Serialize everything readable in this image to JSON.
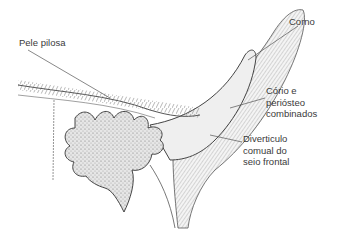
{
  "diagram": {
    "labels": [
      {
        "id": "pele",
        "text": "Pele pilosa"
      },
      {
        "id": "corno",
        "text": "Corno"
      },
      {
        "id": "corio",
        "text": "Cório e\nperiósteo\ncombinados"
      },
      {
        "id": "divert",
        "text": "Diverticulo\ncomual do\nseio frontal"
      }
    ]
  }
}
